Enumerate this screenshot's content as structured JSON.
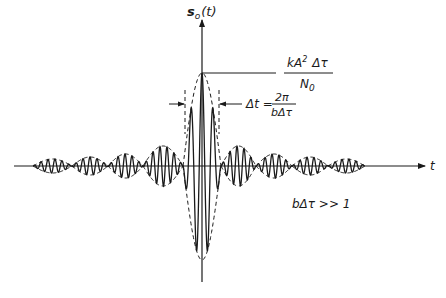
{
  "figure": {
    "y_axis_label": "s",
    "y_axis_label_sub": "o",
    "y_axis_label_arg": "(t)",
    "x_axis_label": "t",
    "peak_annotation": {
      "numerator_k": "kA",
      "numerator_sup": "2",
      "numerator_delta": "Δτ",
      "denominator": "N",
      "denominator_sub": "0"
    },
    "width_annotation": {
      "lhs": "Δt =",
      "numerator": "2π",
      "denominator": "bΔτ"
    },
    "condition": "bΔτ >> 1"
  },
  "colors": {
    "ink": "#1a1a1a",
    "background": "#ffffff"
  },
  "geometry": {
    "origin_x": 202,
    "baseline_y": 166,
    "peak_y": 73,
    "trough_y": 260,
    "x_axis_start": 14,
    "x_axis_end": 425,
    "y_axis_top": 20,
    "y_axis_bottom": 282,
    "main_half_width": 19,
    "carrier_period": 11,
    "left_nulls": [
      33,
      72,
      108,
      143,
      183
    ],
    "right_nulls": [
      221,
      256,
      292,
      328,
      365
    ],
    "side_lobe_amps_left": [
      7,
      9,
      12,
      20
    ],
    "side_lobe_amps_right": [
      20,
      12,
      9,
      7
    ],
    "delta_t_marker_y": 104,
    "delta_t_left_x": 185,
    "delta_t_right_x": 219
  }
}
